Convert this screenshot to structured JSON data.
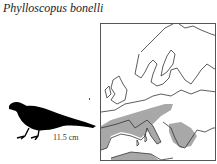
{
  "species": {
    "scientific_name": "Phylloscopus bonelli",
    "length_label": "11.5 cm"
  },
  "map": {
    "region": "Europe",
    "range_color": "#a8a8a8",
    "outline_color": "#333333"
  }
}
